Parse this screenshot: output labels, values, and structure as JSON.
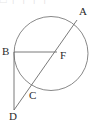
{
  "figure": {
    "background_color": "#ffffff",
    "stroke_color": "#6b6b6b",
    "label_color": "#2b2b2b",
    "width": 100,
    "height": 123
  },
  "circle": {
    "name": "main-circle",
    "center_x": 51,
    "center_y": 53.5,
    "radius": 37,
    "stroke_color": "#7a7a7a",
    "stroke_width": 0.9,
    "fill": "none"
  },
  "points": {
    "A": {
      "label": "A",
      "x": 77,
      "y": 20,
      "label_x": 79,
      "label_y": 6,
      "on_circle": true
    },
    "B": {
      "label": "B",
      "x": 14,
      "y": 52,
      "label_x": 2,
      "label_y": 46,
      "on_circle": true
    },
    "C": {
      "label": "C",
      "x": 27,
      "y": 88,
      "label_x": 29,
      "label_y": 90,
      "on_circle": true
    },
    "D": {
      "label": "D",
      "x": 14,
      "y": 110,
      "label_x": 9,
      "label_y": 111,
      "on_circle": false
    },
    "F": {
      "label": "F",
      "x": 57,
      "y": 52,
      "label_x": 60,
      "label_y": 50,
      "on_circle": false
    }
  },
  "segments": [
    {
      "name": "segment-BF",
      "from": "B",
      "to": "F",
      "x1": 14,
      "y1": 52,
      "x2": 57,
      "y2": 52
    },
    {
      "name": "segment-AD",
      "from": "A",
      "to": "D",
      "x1": 77,
      "y1": 20,
      "x2": 14,
      "y2": 110
    },
    {
      "name": "segment-BD",
      "from": "B",
      "to": "D",
      "x1": 14,
      "y1": 52,
      "x2": 14,
      "y2": 110
    }
  ],
  "artifact": {
    "top_text": "□ ┌ ┐ ┌ ┐"
  }
}
